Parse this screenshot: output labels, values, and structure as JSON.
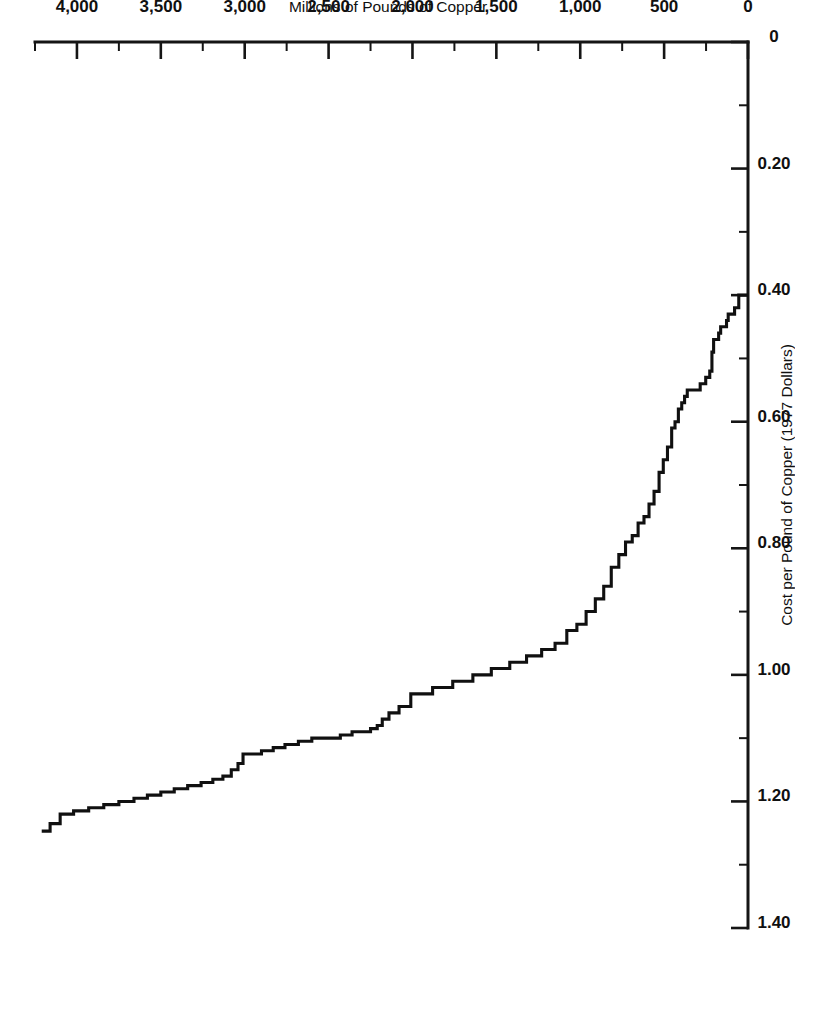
{
  "figure": {
    "orientation_degrees": 180,
    "background_color": "#ffffff",
    "ink_color": "#101010"
  },
  "chart_data": {
    "type": "line",
    "subtype": "step",
    "title": "",
    "subtitle": "",
    "xlabel": "Millions of Pounds of Copper",
    "ylabel": "Cost per Pound of Copper (1977 Dollars)",
    "xlim": [
      0,
      4250
    ],
    "ylim": [
      0,
      1.4
    ],
    "grid": false,
    "legend": null,
    "annotations": [],
    "x_ticks_major": [
      0,
      500,
      1000,
      1500,
      2000,
      2500,
      3000,
      3500,
      4000
    ],
    "x_tick_labels": [
      "0",
      "500",
      "1,000",
      "1,500",
      "2,000",
      "2,500",
      "3,000",
      "3,500",
      "4,000"
    ],
    "x_ticks_minor": [
      250,
      750,
      1250,
      1750,
      2250,
      2750,
      3250,
      3750,
      4250
    ],
    "y_ticks_major": [
      0,
      0.2,
      0.4,
      0.6,
      0.8,
      1.0,
      1.2,
      1.4
    ],
    "y_tick_labels": [
      "0",
      "0.20",
      "0.40",
      "0.60",
      "0.80",
      "1.00",
      "1.20",
      "1.40"
    ],
    "y_ticks_minor": [
      0.1,
      0.3,
      0.5,
      0.7,
      0.9,
      1.1,
      1.3
    ],
    "series": [
      {
        "name": "Copper supply cost curve",
        "x": [
          0,
          55,
          80,
          100,
          118,
          128,
          140,
          150,
          163,
          175,
          190,
          205,
          215,
          228,
          240,
          252,
          268,
          285,
          300,
          318,
          332,
          348,
          362,
          378,
          395,
          415,
          435,
          455,
          480,
          505,
          530,
          560,
          590,
          620,
          655,
          690,
          730,
          770,
          815,
          860,
          910,
          965,
          1020,
          1080,
          1150,
          1230,
          1320,
          1420,
          1530,
          1640,
          1760,
          1880,
          2010,
          2080,
          2140,
          2180,
          2210,
          2250,
          2300,
          2360,
          2430,
          2510,
          2600,
          2680,
          2760,
          2830,
          2900,
          2960,
          3010,
          3040,
          3080,
          3130,
          3190,
          3260,
          3340,
          3420,
          3500,
          3580,
          3660,
          3750,
          3840,
          3930,
          4020,
          4100,
          4160,
          4210
        ],
        "y": [
          0.4,
          0.4,
          0.42,
          0.43,
          0.43,
          0.44,
          0.45,
          0.45,
          0.45,
          0.46,
          0.47,
          0.47,
          0.49,
          0.52,
          0.53,
          0.53,
          0.54,
          0.54,
          0.55,
          0.55,
          0.55,
          0.55,
          0.55,
          0.56,
          0.57,
          0.58,
          0.6,
          0.61,
          0.64,
          0.66,
          0.68,
          0.71,
          0.73,
          0.75,
          0.76,
          0.78,
          0.79,
          0.81,
          0.83,
          0.86,
          0.88,
          0.9,
          0.92,
          0.93,
          0.95,
          0.96,
          0.97,
          0.98,
          0.99,
          1.0,
          1.01,
          1.02,
          1.03,
          1.05,
          1.06,
          1.07,
          1.08,
          1.085,
          1.09,
          1.09,
          1.095,
          1.1,
          1.1,
          1.105,
          1.11,
          1.115,
          1.12,
          1.125,
          1.125,
          1.14,
          1.15,
          1.16,
          1.165,
          1.17,
          1.175,
          1.18,
          1.185,
          1.19,
          1.195,
          1.2,
          1.205,
          1.21,
          1.215,
          1.22,
          1.235,
          1.247
        ]
      }
    ]
  }
}
